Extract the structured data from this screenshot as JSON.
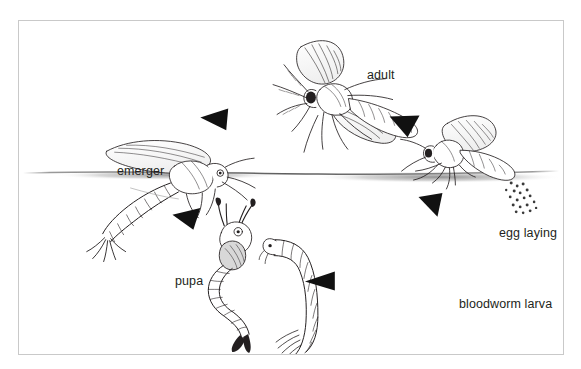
{
  "figure": {
    "type": "life-cycle-diagram",
    "frame": {
      "border_color": "#c9c9c9",
      "background": "#ffffff"
    },
    "ink_color": "#231f20",
    "water_line_color": "#6f6f6f"
  },
  "labels": {
    "adult": "adult",
    "emerger": "emerger",
    "egg_laying": "egg laying",
    "pupa": "pupa",
    "bloodworm_larva": "bloodworm larva"
  },
  "stages": [
    {
      "id": "adult",
      "label": "adult",
      "position": "top-center",
      "above_water": true
    },
    {
      "id": "egg-laying",
      "label": "egg laying",
      "position": "right",
      "above_water": true
    },
    {
      "id": "bloodworm-larva",
      "label": "bloodworm larva",
      "position": "bottom-right",
      "above_water": false
    },
    {
      "id": "pupa",
      "label": "pupa",
      "position": "bottom-left",
      "above_water": false
    },
    {
      "id": "emerger",
      "label": "emerger",
      "position": "left",
      "above_water": false
    }
  ],
  "arrows": [
    {
      "id": "arrow-emerger-to-adult",
      "from": "emerger",
      "to": "adult",
      "direction": "left",
      "x": 200,
      "y": 105
    },
    {
      "id": "arrow-adult-to-egg-laying",
      "from": "adult",
      "to": "egg laying",
      "direction": "left-down",
      "x": 396,
      "y": 112
    },
    {
      "id": "arrow-egg-laying-to-larva",
      "from": "egg laying",
      "to": "bloodworm larva",
      "direction": "right-down",
      "x": 424,
      "y": 198
    },
    {
      "id": "arrow-larva-to-pupa",
      "from": "bloodworm larva",
      "to": "pupa",
      "direction": "left",
      "x": 305,
      "y": 272
    },
    {
      "id": "arrow-pupa-to-emerger",
      "from": "pupa",
      "to": "emerger",
      "direction": "left-up",
      "x": 172,
      "y": 212
    }
  ]
}
